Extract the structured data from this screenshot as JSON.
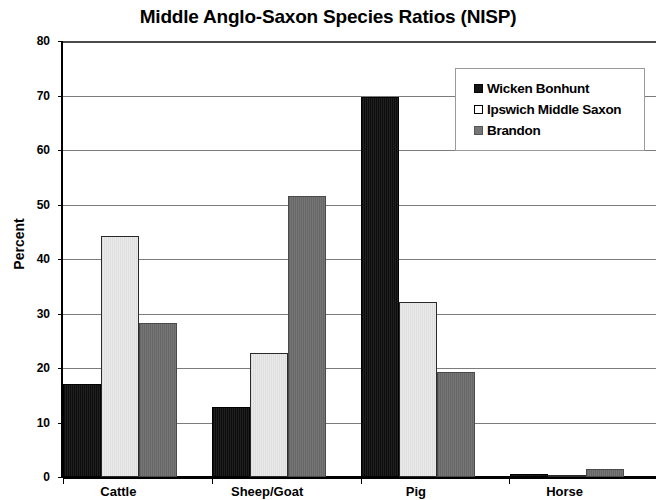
{
  "chart_data": {
    "type": "bar",
    "title": "Middle Anglo-Saxon Species Ratios (NISP)",
    "xlabel": "",
    "ylabel": "Percent",
    "ylim": [
      0,
      80
    ],
    "yticks": [
      0,
      10,
      20,
      30,
      40,
      50,
      60,
      70,
      80
    ],
    "ytick_labels": [
      "0",
      "10",
      "20",
      "30",
      "40",
      "50",
      "60",
      "70",
      "80"
    ],
    "categories": [
      "Cattle",
      "Sheep/Goat",
      "Pig",
      "Horse"
    ],
    "grid": true,
    "legend_position": "top-right",
    "series": [
      {
        "name": "Wicken Bonhunt",
        "color": "#151515",
        "values": [
          17.0,
          12.8,
          69.7,
          0.5
        ]
      },
      {
        "name": "Ipswich Middle Saxon",
        "color": "#e8e8e8",
        "values": [
          44.2,
          22.7,
          32.2,
          0.4
        ]
      },
      {
        "name": "Brandon",
        "color": "#757575",
        "values": [
          28.2,
          51.6,
          19.2,
          1.5
        ]
      }
    ]
  },
  "legend": {
    "entries": [
      {
        "label": "Wicken Bonhunt"
      },
      {
        "label": "Ipswich Middle Saxon"
      },
      {
        "label": "Brandon"
      }
    ]
  }
}
